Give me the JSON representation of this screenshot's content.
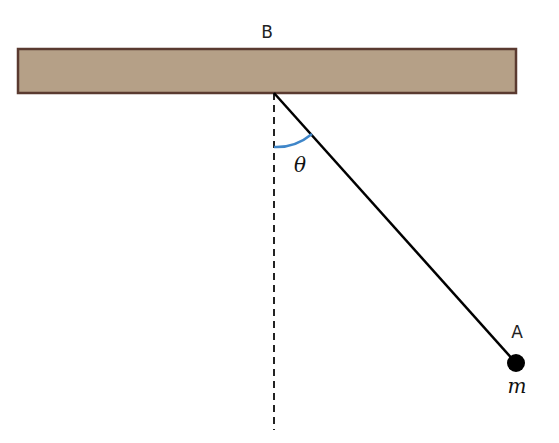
{
  "diagram": {
    "labels": {
      "pivot": "B",
      "bob": "A",
      "mass": "m",
      "angle": "θ"
    },
    "colors": {
      "beam_fill": "#b5a087",
      "beam_border": "#5a3a30",
      "string": "#000000",
      "bob": "#000000",
      "angle_arc": "#3f86c9",
      "reference_line": "#222222"
    }
  }
}
